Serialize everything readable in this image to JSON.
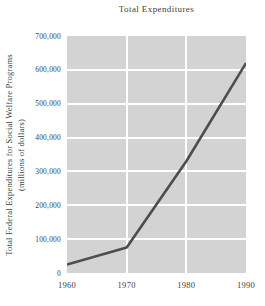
{
  "title": "Total Expenditures",
  "y_axis": {
    "label_line1": "Total Federal Expenditures for Social Welfare Programs",
    "label_line2": "(millions of dollars)",
    "tick_labels": [
      "700,000",
      "600,000",
      "500,000",
      "400,000",
      "300,000",
      "200,000",
      "100,000",
      "0"
    ]
  },
  "x_axis": {
    "tick_labels": [
      "1960",
      "1970",
      "1980",
      "1990"
    ]
  },
  "chart_data": {
    "type": "line",
    "title": "Total Expenditures",
    "xlabel": "",
    "ylabel": "Total Federal Expenditures for Social Welfare Programs (millions of dollars)",
    "x": [
      1960,
      1970,
      1980,
      1990
    ],
    "values": [
      25000,
      75000,
      330000,
      620000
    ],
    "xlim": [
      1960,
      1990
    ],
    "ylim": [
      0,
      700000
    ],
    "y_tick_step": 100000,
    "x_tick_step": 10,
    "grid": true,
    "gridline_years_interior": [
      1970,
      1980
    ],
    "legend_position": "none",
    "series_name": "Total Federal Expenditures for Social Welfare Programs"
  },
  "colors": {
    "page_background": "#ffffff",
    "plot_background": "#d3d3d3",
    "gridline": "#ffffff",
    "line": "#4d4d4d",
    "text": "#42423a"
  }
}
